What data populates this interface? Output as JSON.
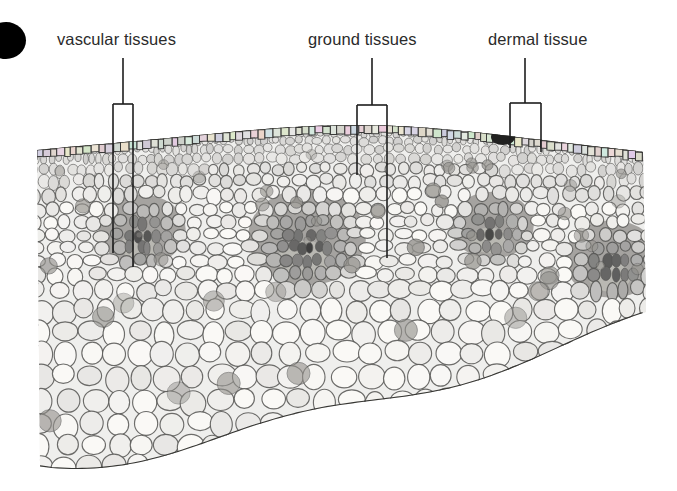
{
  "figure": {
    "type": "light-micrograph",
    "background_color": "#ffffff"
  },
  "callouts": [
    {
      "id": "vascular",
      "label": "vascular tissues",
      "label_x": 57,
      "label_y": 31,
      "leader": {
        "style": "pointer-box",
        "stem_x": 123,
        "stem_top": 58,
        "box_top": 104,
        "box_left": 113,
        "box_right": 133,
        "box_bottom_left": 253,
        "box_bottom_right": 267
      }
    },
    {
      "id": "ground",
      "label": "ground tissues",
      "label_x": 308,
      "label_y": 31,
      "leader": {
        "style": "pointer-box",
        "stem_x": 372,
        "stem_top": 58,
        "box_top": 105,
        "box_left": 357,
        "box_right": 387,
        "box_bottom_left": 175,
        "box_bottom_right": 258
      }
    },
    {
      "id": "dermal",
      "label": "dermal tissue",
      "label_x": 488,
      "label_y": 31,
      "leader": {
        "style": "bracket",
        "stem_x": 525,
        "stem_top": 58,
        "box_top": 103,
        "box_left": 510,
        "box_right": 541,
        "box_bottom_left": 148,
        "box_bottom_right": 152
      }
    }
  ],
  "micrograph": {
    "x": 37,
    "y": 112,
    "width": 609,
    "height": 360,
    "tone_light": "#f2f1ef",
    "tone_mid": "#9a9894",
    "tone_dark": "#3a3a38",
    "wall_color": "#4a4a48",
    "epidermis_rows": 2,
    "cortex_small_cell_band": 60,
    "vascular_bundles": [
      {
        "cx": 105,
        "cy": 125,
        "rx": 46,
        "ry": 40,
        "label": "bundle-1"
      },
      {
        "cx": 270,
        "cy": 135,
        "rx": 62,
        "ry": 55,
        "label": "bundle-2"
      },
      {
        "cx": 455,
        "cy": 120,
        "rx": 44,
        "ry": 38,
        "label": "bundle-3"
      },
      {
        "cx": 575,
        "cy": 155,
        "rx": 50,
        "ry": 44,
        "label": "bundle-4"
      }
    ],
    "dark_epidermal_spot": {
      "cx": 466,
      "cy": 25,
      "rx": 12,
      "ry": 8
    }
  }
}
